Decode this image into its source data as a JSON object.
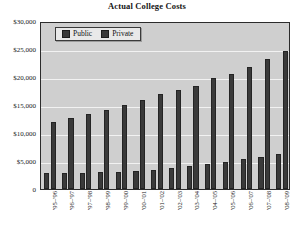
{
  "chart_data": {
    "type": "bar",
    "title": "Actual College Costs",
    "xlabel": "",
    "ylabel": "",
    "ylim": [
      0,
      30000
    ],
    "grid": true,
    "legend_position": "top-left",
    "ytick_labels": [
      "0",
      "$5,000",
      "$10,000",
      "$15,000",
      "$20,000",
      "$25,000",
      "$30,000"
    ],
    "ytick_values": [
      0,
      5000,
      10000,
      15000,
      20000,
      25000,
      30000
    ],
    "categories": [
      "'95–'96",
      "'96–'97",
      "'97–'98",
      "'98–'99",
      "'99–'00",
      "'00–'01",
      "'01–'02",
      "'02–'03",
      "'03–'04",
      "'04–'05",
      "'05–'06",
      "'06–'07",
      "'07–'08",
      "'08–'09"
    ],
    "series": [
      {
        "name": "Public",
        "color": "#3a3a3a",
        "values": [
          2850,
          2900,
          2950,
          3000,
          3100,
          3250,
          3450,
          3750,
          4100,
          4500,
          4900,
          5350,
          5800,
          6350
        ]
      },
      {
        "name": "Private",
        "color": "#3a3a3a",
        "values": [
          12200,
          12900,
          13600,
          14300,
          15100,
          16000,
          17200,
          17900,
          18700,
          20000,
          20700,
          22000,
          23500,
          24900
        ]
      }
    ]
  },
  "legend": {
    "items": [
      {
        "label": "Public"
      },
      {
        "label": "Private"
      }
    ]
  }
}
